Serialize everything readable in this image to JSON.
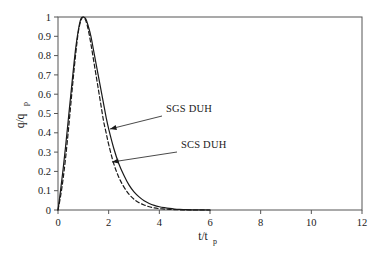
{
  "chart_data": {
    "type": "line",
    "title": "",
    "xlabel": "t/tp",
    "xlabel_main": "t/t",
    "xlabel_sub": "p",
    "ylabel": "q/qp",
    "ylabel_main": "q/q",
    "ylabel_sub": "p",
    "xlim": [
      0,
      12
    ],
    "ylim": [
      0,
      1
    ],
    "grid": false,
    "legend_position": "inline-annotations",
    "x_ticks": [
      0,
      2,
      4,
      6,
      8,
      10,
      12
    ],
    "x_tick_labels": [
      "0",
      "2",
      "4",
      "6",
      "8",
      "10",
      "12"
    ],
    "y_ticks": [
      0,
      0.1,
      0.2,
      0.3,
      0.4,
      0.5,
      0.6,
      0.7,
      0.8,
      0.9,
      1
    ],
    "y_tick_labels": [
      "0",
      "0.1",
      "0.2",
      "0.3",
      "0.4",
      "0.5",
      "0.6",
      "0.7",
      "0.8",
      "0.9",
      "1"
    ],
    "series": [
      {
        "name": "SGS DUH",
        "style": "solid",
        "color": "#1a1a1a",
        "x": [
          0,
          0.1,
          0.2,
          0.3,
          0.4,
          0.5,
          0.6,
          0.7,
          0.8,
          0.9,
          1.0,
          1.1,
          1.2,
          1.3,
          1.4,
          1.5,
          1.6,
          1.7,
          1.8,
          1.9,
          2.0,
          2.2,
          2.4,
          2.6,
          2.8,
          3.0,
          3.2,
          3.4,
          3.6,
          3.8,
          4.0,
          4.2,
          4.4,
          4.6,
          4.8,
          5.0,
          5.2,
          5.5,
          6.0
        ],
        "y": [
          0,
          0.1,
          0.21,
          0.33,
          0.46,
          0.59,
          0.72,
          0.84,
          0.93,
          0.99,
          1.0,
          0.99,
          0.95,
          0.9,
          0.83,
          0.76,
          0.69,
          0.62,
          0.55,
          0.48,
          0.42,
          0.32,
          0.24,
          0.18,
          0.13,
          0.094,
          0.068,
          0.048,
          0.034,
          0.024,
          0.017,
          0.012,
          0.008,
          0.005,
          0.003,
          0.002,
          0.001,
          0.0005,
          0
        ]
      },
      {
        "name": "SCS DUH",
        "style": "dashed",
        "color": "#1a1a1a",
        "x": [
          0,
          0.1,
          0.2,
          0.3,
          0.4,
          0.5,
          0.6,
          0.7,
          0.8,
          0.9,
          1.0,
          1.1,
          1.2,
          1.3,
          1.4,
          1.5,
          1.6,
          1.7,
          1.8,
          1.9,
          2.0,
          2.2,
          2.4,
          2.6,
          2.8,
          3.0,
          3.2,
          3.4,
          3.6,
          3.8,
          4.0,
          4.2,
          4.4,
          4.6,
          4.8,
          5.0,
          5.2,
          5.5,
          6.0
        ],
        "y": [
          0,
          0.07,
          0.16,
          0.27,
          0.4,
          0.54,
          0.68,
          0.81,
          0.92,
          0.98,
          1.0,
          0.98,
          0.93,
          0.86,
          0.78,
          0.7,
          0.62,
          0.54,
          0.46,
          0.4,
          0.34,
          0.24,
          0.17,
          0.12,
          0.082,
          0.056,
          0.038,
          0.026,
          0.017,
          0.011,
          0.007,
          0.005,
          0.003,
          0.002,
          0.001,
          0.0005,
          0.0002,
          0,
          0
        ]
      }
    ],
    "annotations": [
      {
        "text": "SGS DUH",
        "label_x": 166,
        "label_y": 112,
        "leader_from_x": 162,
        "leader_from_y": 116,
        "arrow_to_x": 110,
        "arrow_to_y": 129
      },
      {
        "text": "SCS DUH",
        "label_x": 181,
        "label_y": 148,
        "leader_from_x": 177,
        "leader_from_y": 152,
        "arrow_to_x": 112,
        "arrow_to_y": 162
      }
    ]
  }
}
